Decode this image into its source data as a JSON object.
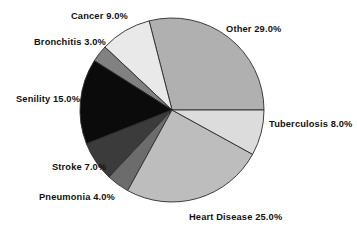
{
  "chart_data": {
    "type": "pie",
    "title": "",
    "subtitle": "",
    "xlabel": "",
    "ylabel": "",
    "legend_position": "none",
    "grid": false,
    "label_format": "{name} {value}%",
    "start_angle_deg": 0,
    "direction": "counterclockwise",
    "center": {
      "cx": 172,
      "cy": 110,
      "r": 92
    },
    "categories": [
      "Other",
      "Cancer",
      "Bronchitis",
      "Senility",
      "Stroke",
      "Pneumonia",
      "Heart Disease",
      "Tuberculosis"
    ],
    "values": [
      29.0,
      9.0,
      3.0,
      15.0,
      7.0,
      4.0,
      25.0,
      8.0
    ],
    "total": 100.0,
    "colors": [
      "#b0b0b0",
      "#e9e9e9",
      "#818181",
      "#0b0b0b",
      "#3b3b3b",
      "#6c6c6c",
      "#bdbdbd",
      "#dcdcdc"
    ],
    "slices": [
      {
        "name": "Other",
        "value": 29.0,
        "label": "Other 29.0%",
        "color": "#b0b0b0"
      },
      {
        "name": "Cancer",
        "value": 9.0,
        "label": "Cancer 9.0%",
        "color": "#e9e9e9"
      },
      {
        "name": "Bronchitis",
        "value": 3.0,
        "label": "Bronchitis 3.0%",
        "color": "#818181"
      },
      {
        "name": "Senility",
        "value": 15.0,
        "label": "Senility 15.0%",
        "color": "#0b0b0b"
      },
      {
        "name": "Stroke",
        "value": 7.0,
        "label": "Stroke 7.0%",
        "color": "#3b3b3b"
      },
      {
        "name": "Pneumonia",
        "value": 4.0,
        "label": "Pneumonia 4.0%",
        "color": "#6c6c6c"
      },
      {
        "name": "Heart Disease",
        "value": 25.0,
        "label": "Heart Disease 25.0%",
        "color": "#bdbdbd"
      },
      {
        "name": "Tuberculosis",
        "value": 8.0,
        "label": "Tuberculosis 8.0%",
        "color": "#dcdcdc"
      }
    ]
  },
  "labels": {
    "cancer": "Cancer 9.0%",
    "bronchitis": "Bronchitis 3.0%",
    "senility": "Senility 15.0%",
    "stroke": "Stroke 7.0%",
    "pneumonia": "Pneumonia 4.0%",
    "heart_disease": "Heart Disease 25.0%",
    "tuberculosis": "Tuberculosis 8.0%",
    "other": "Other 29.0%"
  },
  "style": {
    "background": "#ffffff",
    "slice_outline": "#2b2b2b",
    "text_color": "#121212"
  }
}
